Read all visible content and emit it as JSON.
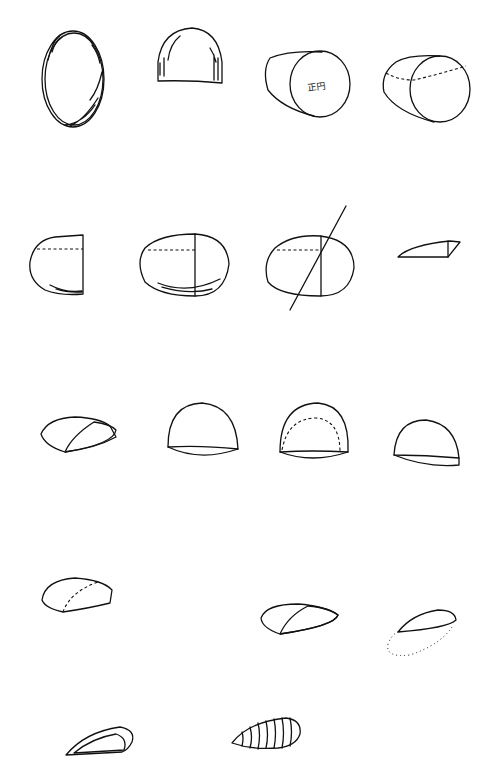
{
  "diagram": {
    "title": "",
    "rows": [
      {
        "row": 1,
        "figures": [
          "rough-oval-hatched",
          "dome-hatched-sides",
          "cylinder-circle-face",
          "cylinder-dashed-midline"
        ]
      },
      {
        "row": 2,
        "figures": [
          "half-oval-dashed",
          "oval-split-dashed",
          "oval-diagonal-cut",
          "thin-wedge"
        ]
      },
      {
        "row": 3,
        "figures": [
          "sliced-loaf-hatched",
          "dome",
          "dome-dashed-inner",
          "small-dome"
        ]
      },
      {
        "row": 4,
        "figures": [
          "loaf-dashed-curve",
          "sliced-loaf-hatched-2",
          "hatched-ellipse-dotted"
        ]
      },
      {
        "row": 5,
        "figures": [
          "hatched-crescent",
          "ribbed-seed"
        ]
      }
    ],
    "annotations": {
      "circle_label": "正円"
    }
  }
}
